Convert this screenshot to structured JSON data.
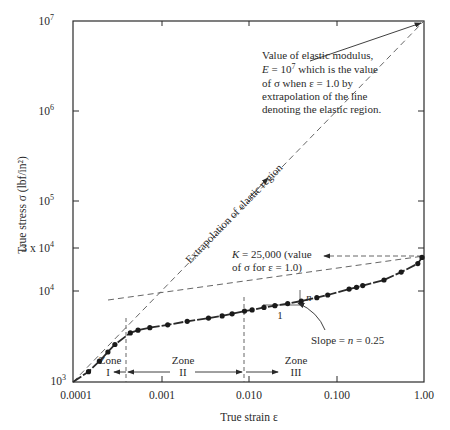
{
  "chart_data": {
    "type": "line",
    "title": "",
    "xlabel": "True strain ε",
    "ylabel": "True stress σ (lbf/in²)",
    "xscale": "log",
    "yscale": "log",
    "xlim": [
      0.0001,
      1.0
    ],
    "ylim": [
      1000,
      10000000
    ],
    "x_ticks": [
      "0.0001",
      "0.001",
      "0.010",
      "0.100",
      "1.00"
    ],
    "y_ticks": [
      {
        "base": "10",
        "exp": "7",
        "value": 10000000
      },
      {
        "base": "10",
        "exp": "6",
        "value": 1000000
      },
      {
        "base": "10",
        "exp": "5",
        "value": 100000
      },
      {
        "base": "3 x 10",
        "exp": "4",
        "value": 30000
      },
      {
        "base": "10",
        "exp": "4",
        "value": 10000
      },
      {
        "base": "10",
        "exp": "3",
        "value": 1000
      }
    ],
    "grid": false,
    "series": [
      {
        "name": "Measured true stress-strain",
        "style": "solid-dashed with dots",
        "points": [
          [
            0.00015,
            1300
          ],
          [
            0.0002,
            1700
          ],
          [
            0.00025,
            2150
          ],
          [
            0.0003,
            2600
          ],
          [
            0.00045,
            3500
          ],
          [
            0.00055,
            3750
          ],
          [
            0.00075,
            4000
          ],
          [
            0.0012,
            4300
          ],
          [
            0.002,
            4700
          ],
          [
            0.0035,
            5100
          ],
          [
            0.005,
            5400
          ],
          [
            0.0065,
            5700
          ],
          [
            0.009,
            6100
          ],
          [
            0.011,
            6300
          ],
          [
            0.015,
            6700
          ],
          [
            0.02,
            7000
          ],
          [
            0.028,
            7400
          ],
          [
            0.04,
            7900
          ],
          [
            0.06,
            8600
          ],
          [
            0.08,
            9200
          ],
          [
            0.14,
            10700
          ],
          [
            0.17,
            11200
          ],
          [
            0.2,
            11700
          ],
          [
            0.35,
            13500
          ],
          [
            0.55,
            16500
          ],
          [
            0.85,
            20500
          ],
          [
            0.95,
            24000
          ]
        ]
      },
      {
        "name": "Extrapolation of elastic region",
        "style": "dashed",
        "points": [
          [
            0.0001,
            1000
          ],
          [
            1.0,
            10000000
          ]
        ]
      },
      {
        "name": "Plastic fit (K=25,000, n=0.25)",
        "style": "dashed",
        "points": [
          [
            0.0005,
            3850
          ],
          [
            1.0,
            25000
          ]
        ]
      }
    ],
    "annotations": [
      "Value of elastic modulus, E = 10^7 which is the value of σ when ε = 1.0 by extrapolation of the line denoting the elastic region.",
      "Extrapolation of elastic region",
      "K = 25,000 (value of σ for ε = 1.0)",
      "Slope = n = 0.25",
      "Zone I",
      "Zone II",
      "Zone III"
    ],
    "zone_boundaries_strain": [
      0.0004,
      0.009
    ]
  },
  "labels": {
    "x_title": "True strain ε",
    "y_title": "True stress σ (lbf/in²)",
    "x_ticks": [
      "0.0001",
      "0.001",
      "0.010",
      "0.100",
      "1.00"
    ],
    "y_10_7": "10",
    "y_10_7_exp": "7",
    "y_10_6": "10",
    "y_10_6_exp": "6",
    "y_10_5": "10",
    "y_10_5_exp": "5",
    "y_3e4": "3 x 10",
    "y_3e4_exp": "4",
    "y_10_4": "10",
    "y_10_4_exp": "4",
    "y_10_3": "10",
    "y_10_3_exp": "3",
    "modulus_note": [
      "Value of elastic modulus,",
      "E = 10",
      "7",
      " which is the value",
      "of σ when ε = 1.0 by",
      "extrapolation of the line",
      "denoting the elastic region."
    ],
    "extrapolation_label": "Extrapolation of elastic region",
    "k_note_line1": "K = 25,000 (value",
    "k_note_line2": "of σ for ε = 1.0)",
    "slope_one": "1",
    "slope_n": "n",
    "slope_note": "Slope = n = 0.25",
    "zone_word": "Zone",
    "zone_1": "I",
    "zone_2": "II",
    "zone_3": "III"
  },
  "colors": {
    "ink": "#2a2a2a",
    "dashed": "#555555",
    "background": "#ffffff"
  }
}
